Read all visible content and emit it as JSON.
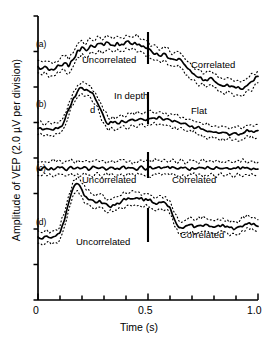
{
  "figure": {
    "name": "vep-amplitude-time-series",
    "background": "#ffffff",
    "trace_color": "#000000",
    "band_color": "#000000"
  },
  "axes": {
    "y": {
      "label": "Amplitude of VEP (2.0 µV per division)",
      "range": [
        0,
        16
      ],
      "major_ticks": [
        0,
        2,
        4,
        6,
        8,
        10,
        12,
        14,
        16
      ],
      "tick_labels": []
    },
    "x": {
      "label": "Time (s)",
      "range": [
        0,
        1.0
      ],
      "ticks": [
        0,
        0.1,
        0.2,
        0.3,
        0.4,
        0.5,
        0.6,
        0.7,
        0.8,
        0.9,
        1.0
      ],
      "tick_labels": [
        {
          "value": 0,
          "text": "0"
        },
        {
          "value": 0.5,
          "text": "0.5"
        },
        {
          "value": 1.0,
          "text": "1.0"
        }
      ]
    }
  },
  "panels": [
    {
      "tag": "(a)",
      "marker_time": 0.5,
      "annotations": [
        {
          "text": "Uncorrelated",
          "x": 0.21,
          "y_px": 60
        },
        {
          "text": "Correlated",
          "x": 0.69,
          "y_px": 65
        }
      ]
    },
    {
      "tag": "(b)",
      "marker_time": 0.5,
      "annotations": [
        {
          "text": "In depth",
          "x": 0.33,
          "y_px": 96
        },
        {
          "text": "d",
          "x": 0.235,
          "y_px": 110
        },
        {
          "text": "Flat",
          "x": 0.7,
          "y_px": 111
        }
      ]
    },
    {
      "tag": "(c)",
      "marker_time": 0.5,
      "annotations": [
        {
          "text": "Uncorrelated",
          "x": 0.215,
          "y_px": 180
        },
        {
          "text": "Correlated",
          "x": 0.625,
          "y_px": 180
        }
      ]
    },
    {
      "tag": "(d)",
      "marker_time": 0.5,
      "annotations": [
        {
          "text": "Uncorrelated",
          "x": 0.205,
          "y_px": 242
        },
        {
          "text": "Correlated",
          "x": 0.665,
          "y_px": 235
        }
      ]
    }
  ],
  "chart_data": {
    "type": "line",
    "title": "",
    "xlabel": "Time (s)",
    "ylabel": "Amplitude of VEP (2.0 µV per division)",
    "xlim": [
      0,
      1.0
    ],
    "ylim": [
      0,
      16
    ],
    "grid": false,
    "legend": "none",
    "x": [
      0.0,
      0.02,
      0.04,
      0.06,
      0.08,
      0.1,
      0.12,
      0.14,
      0.16,
      0.18,
      0.2,
      0.22,
      0.24,
      0.26,
      0.28,
      0.3,
      0.32,
      0.34,
      0.36,
      0.38,
      0.4,
      0.42,
      0.44,
      0.46,
      0.48,
      0.5,
      0.52,
      0.54,
      0.56,
      0.58,
      0.6,
      0.62,
      0.64,
      0.66,
      0.68,
      0.7,
      0.72,
      0.74,
      0.76,
      0.78,
      0.8,
      0.82,
      0.84,
      0.86,
      0.88,
      0.9,
      0.92,
      0.94,
      0.96,
      0.98,
      1.0
    ],
    "series": [
      {
        "name": "(a) mean",
        "panel": "a",
        "values": [
          13.15,
          13.05,
          13.1,
          13.0,
          13.05,
          13.2,
          13.35,
          13.15,
          13.55,
          14.05,
          14.25,
          14.05,
          14.35,
          14.25,
          14.45,
          14.35,
          14.5,
          14.35,
          14.5,
          14.4,
          14.55,
          14.45,
          14.5,
          14.4,
          14.3,
          14.2,
          13.95,
          13.9,
          13.75,
          13.85,
          13.6,
          13.55,
          13.6,
          13.35,
          13.05,
          12.8,
          12.6,
          12.55,
          12.4,
          12.5,
          12.35,
          12.15,
          12.05,
          12.15,
          12.05,
          11.95,
          11.9,
          12.0,
          12.2,
          12.35,
          12.6
        ]
      },
      {
        "name": "(a) upper band",
        "panel": "a",
        "values": [
          13.5,
          13.42,
          13.46,
          13.38,
          13.43,
          13.58,
          13.72,
          13.55,
          13.94,
          14.43,
          14.62,
          14.44,
          14.72,
          14.63,
          14.82,
          14.72,
          14.86,
          14.72,
          14.86,
          14.77,
          14.91,
          14.82,
          14.86,
          14.77,
          14.68,
          14.58,
          14.33,
          14.28,
          14.13,
          14.22,
          13.98,
          13.93,
          13.97,
          13.73,
          13.44,
          13.19,
          12.99,
          12.94,
          12.79,
          12.88,
          12.73,
          12.54,
          12.44,
          12.53,
          12.44,
          12.34,
          12.29,
          12.38,
          12.57,
          12.72,
          12.96
        ]
      },
      {
        "name": "(a) lower band",
        "panel": "a",
        "values": [
          12.8,
          12.68,
          12.74,
          12.62,
          12.67,
          12.82,
          12.98,
          12.75,
          13.16,
          13.67,
          13.88,
          13.66,
          13.98,
          13.87,
          14.08,
          13.98,
          14.14,
          13.98,
          14.14,
          14.03,
          14.19,
          14.08,
          14.14,
          14.03,
          13.92,
          13.82,
          13.57,
          13.52,
          13.37,
          13.48,
          13.22,
          13.17,
          13.23,
          12.97,
          12.66,
          12.41,
          12.21,
          12.16,
          12.01,
          12.12,
          11.97,
          11.76,
          11.66,
          11.77,
          11.66,
          11.56,
          11.51,
          11.62,
          11.83,
          11.98,
          12.24
        ]
      },
      {
        "name": "(b) mean",
        "panel": "b",
        "values": [
          9.65,
          9.6,
          9.65,
          9.6,
          9.7,
          9.75,
          10.1,
          10.75,
          11.35,
          11.75,
          11.95,
          11.85,
          11.7,
          11.35,
          10.85,
          10.3,
          9.9,
          10.0,
          9.95,
          10.1,
          10.0,
          10.15,
          10.1,
          10.2,
          10.15,
          10.2,
          10.25,
          10.2,
          10.25,
          10.2,
          10.15,
          10.1,
          10.0,
          9.95,
          9.85,
          9.8,
          9.7,
          9.65,
          9.55,
          9.5,
          9.45,
          9.4,
          9.45,
          9.4,
          9.35,
          9.4,
          9.35,
          9.45,
          9.5,
          9.45,
          9.55
        ]
      },
      {
        "name": "(b) upper band",
        "panel": "b",
        "values": [
          9.98,
          9.93,
          9.98,
          9.93,
          10.03,
          10.09,
          10.45,
          11.1,
          11.7,
          12.08,
          12.28,
          12.18,
          12.03,
          11.69,
          11.2,
          10.65,
          10.25,
          10.34,
          10.29,
          10.44,
          10.34,
          10.49,
          10.44,
          10.54,
          10.49,
          10.54,
          10.59,
          10.54,
          10.59,
          10.54,
          10.49,
          10.44,
          10.34,
          10.29,
          10.19,
          10.14,
          10.04,
          9.99,
          9.89,
          9.84,
          9.79,
          9.74,
          9.79,
          9.74,
          9.69,
          9.74,
          9.69,
          9.79,
          9.84,
          9.79,
          9.89
        ]
      },
      {
        "name": "(b) lower band",
        "panel": "b",
        "values": [
          9.32,
          9.27,
          9.32,
          9.27,
          9.37,
          9.41,
          9.75,
          10.4,
          11.0,
          11.42,
          11.62,
          11.52,
          11.37,
          11.01,
          10.5,
          9.95,
          9.55,
          9.66,
          9.61,
          9.76,
          9.66,
          9.81,
          9.76,
          9.86,
          9.81,
          9.86,
          9.91,
          9.86,
          9.91,
          9.86,
          9.81,
          9.76,
          9.66,
          9.61,
          9.51,
          9.46,
          9.36,
          9.31,
          9.21,
          9.16,
          9.11,
          9.06,
          9.11,
          9.06,
          9.01,
          9.06,
          9.01,
          9.11,
          9.16,
          9.11,
          9.21
        ]
      },
      {
        "name": "(c) mean",
        "panel": "c",
        "values": [
          7.4,
          7.42,
          7.38,
          7.44,
          7.4,
          7.46,
          7.38,
          7.44,
          7.4,
          7.48,
          7.42,
          7.46,
          7.4,
          7.48,
          7.42,
          7.44,
          7.4,
          7.46,
          7.42,
          7.48,
          7.4,
          7.44,
          7.38,
          7.46,
          7.42,
          7.44,
          7.4,
          7.46,
          7.42,
          7.48,
          7.42,
          7.46,
          7.4,
          7.44,
          7.38,
          7.44,
          7.4,
          7.46,
          7.4,
          7.44,
          7.38,
          7.44,
          7.4,
          7.44,
          7.38,
          7.42,
          7.38,
          7.44,
          7.4,
          7.42,
          7.38
        ]
      },
      {
        "name": "(c) upper band",
        "panel": "c",
        "values": [
          7.78,
          7.8,
          7.76,
          7.84,
          7.78,
          7.86,
          7.76,
          7.84,
          7.8,
          7.88,
          7.8,
          7.86,
          7.78,
          7.88,
          7.8,
          7.84,
          7.78,
          7.86,
          7.8,
          7.88,
          7.78,
          7.84,
          7.76,
          7.86,
          7.8,
          7.84,
          7.78,
          7.86,
          7.8,
          7.88,
          7.8,
          7.86,
          7.78,
          7.84,
          7.76,
          7.84,
          7.78,
          7.86,
          7.78,
          7.84,
          7.76,
          7.84,
          7.78,
          7.84,
          7.76,
          7.82,
          7.76,
          7.84,
          7.78,
          7.82,
          7.76
        ]
      },
      {
        "name": "(c) lower band",
        "panel": "c",
        "values": [
          7.02,
          7.04,
          7.0,
          7.06,
          7.02,
          7.08,
          7.0,
          7.06,
          7.0,
          7.1,
          7.04,
          7.08,
          7.02,
          7.1,
          7.04,
          7.06,
          7.02,
          7.08,
          7.04,
          7.1,
          7.02,
          7.06,
          7.0,
          7.08,
          7.04,
          7.06,
          7.02,
          7.08,
          7.04,
          7.1,
          7.04,
          7.08,
          7.02,
          7.06,
          7.0,
          7.06,
          7.02,
          7.08,
          7.02,
          7.06,
          7.0,
          7.06,
          7.02,
          7.06,
          7.0,
          7.04,
          7.0,
          7.06,
          7.02,
          7.04,
          7.0
        ]
      },
      {
        "name": "(d) mean",
        "panel": "d",
        "values": [
          3.55,
          3.45,
          3.6,
          3.5,
          3.6,
          3.8,
          4.5,
          5.5,
          6.3,
          6.55,
          6.2,
          5.8,
          5.65,
          5.5,
          5.6,
          5.45,
          5.3,
          5.35,
          5.45,
          5.55,
          5.65,
          5.7,
          5.72,
          5.7,
          5.6,
          5.62,
          5.5,
          5.4,
          5.5,
          5.45,
          5.2,
          4.55,
          4.1,
          4.05,
          4.2,
          4.25,
          4.15,
          4.2,
          4.25,
          4.15,
          4.1,
          4.2,
          4.25,
          4.15,
          4.1,
          4.05,
          4.15,
          4.25,
          4.35,
          4.3,
          4.15
        ]
      },
      {
        "name": "(d) upper band",
        "panel": "d",
        "values": [
          3.9,
          3.8,
          3.95,
          3.85,
          3.96,
          4.17,
          4.88,
          5.9,
          6.7,
          6.94,
          6.58,
          6.18,
          6.02,
          5.87,
          5.97,
          5.82,
          5.67,
          5.72,
          5.82,
          5.92,
          6.02,
          6.07,
          6.09,
          6.07,
          5.97,
          5.99,
          5.87,
          5.77,
          5.87,
          5.82,
          5.57,
          4.92,
          4.47,
          4.42,
          4.57,
          4.62,
          4.52,
          4.57,
          4.62,
          4.52,
          4.47,
          4.57,
          4.62,
          4.52,
          4.47,
          4.42,
          4.52,
          4.62,
          4.72,
          4.67,
          4.52
        ]
      },
      {
        "name": "(d) lower band",
        "panel": "d",
        "values": [
          3.2,
          3.1,
          3.25,
          3.15,
          3.24,
          3.43,
          4.12,
          5.1,
          5.9,
          6.16,
          5.82,
          5.42,
          5.28,
          5.13,
          5.23,
          5.08,
          4.93,
          4.98,
          5.08,
          5.18,
          5.28,
          5.33,
          5.35,
          5.33,
          5.23,
          5.25,
          5.13,
          5.03,
          5.13,
          5.08,
          4.83,
          4.18,
          3.73,
          3.68,
          3.83,
          3.88,
          3.78,
          3.83,
          3.88,
          3.78,
          3.73,
          3.83,
          3.88,
          3.78,
          3.73,
          3.68,
          3.78,
          3.88,
          3.98,
          3.93,
          3.78
        ]
      }
    ],
    "markers": [
      {
        "panel": "a",
        "time": 0.5
      },
      {
        "panel": "b",
        "time": 0.5
      },
      {
        "panel": "c",
        "time": 0.5
      },
      {
        "panel": "d",
        "time": 0.5
      }
    ],
    "annotations": [
      {
        "panel": "a",
        "text": "Uncorrelated"
      },
      {
        "panel": "a",
        "text": "Correlated"
      },
      {
        "panel": "b",
        "text": "In depth"
      },
      {
        "panel": "b",
        "text": "d"
      },
      {
        "panel": "b",
        "text": "Flat"
      },
      {
        "panel": "c",
        "text": "Uncorrelated"
      },
      {
        "panel": "c",
        "text": "Correlated"
      },
      {
        "panel": "d",
        "text": "Uncorrelated"
      },
      {
        "panel": "d",
        "text": "Correlated"
      }
    ]
  }
}
